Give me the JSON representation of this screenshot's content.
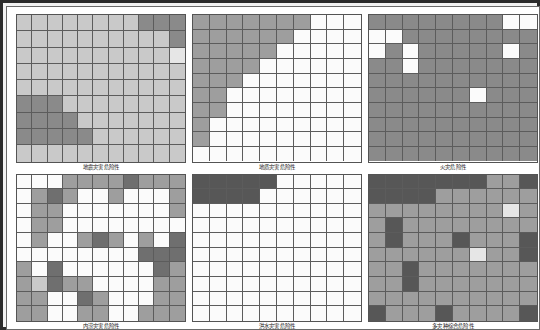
{
  "figure": {
    "title": "",
    "frame_color": "#2b2b2b",
    "background": "#ffffff",
    "grid_line_color": "#5c5c5c",
    "rows": 2,
    "columns": 3
  },
  "legend_palette": {
    "white": "#fbfbfb",
    "very_light": "#e6e6e6",
    "light": "#c9c9c9",
    "medium_light": "#b4b4b4",
    "medium": "#9e9e9e",
    "medium_dark": "#8a8a8a",
    "dark": "#6f6f6f",
    "very_dark": "#575757"
  },
  "chart_data": {
    "type": "heatmap",
    "title": "",
    "subtitle": "",
    "xlabel": "",
    "ylabel": "",
    "grid": true,
    "legend_position": "none",
    "colorscale": "grayscale (light = low hazard, dark = high hazard)",
    "panels": [
      {
        "id": "panel-earthquake-hazard",
        "caption": "地震灾害危险性",
        "cols": 11,
        "rows": 9,
        "values": [
          [
            "#c9c9c9",
            "#c9c9c9",
            "#c9c9c9",
            "#c9c9c9",
            "#c9c9c9",
            "#c9c9c9",
            "#c9c9c9",
            "#c9c9c9",
            "#8a8a8a",
            "#8a8a8a",
            "#8a8a8a"
          ],
          [
            "#c9c9c9",
            "#c9c9c9",
            "#c9c9c9",
            "#c9c9c9",
            "#c9c9c9",
            "#c9c9c9",
            "#c9c9c9",
            "#c9c9c9",
            "#c9c9c9",
            "#c9c9c9",
            "#8a8a8a"
          ],
          [
            "#c9c9c9",
            "#c9c9c9",
            "#c9c9c9",
            "#c9c9c9",
            "#c9c9c9",
            "#c9c9c9",
            "#c9c9c9",
            "#c9c9c9",
            "#c9c9c9",
            "#c9c9c9",
            "#e6e6e6"
          ],
          [
            "#c9c9c9",
            "#c9c9c9",
            "#c9c9c9",
            "#c9c9c9",
            "#c9c9c9",
            "#c9c9c9",
            "#c9c9c9",
            "#c9c9c9",
            "#c9c9c9",
            "#c9c9c9",
            "#c9c9c9"
          ],
          [
            "#c9c9c9",
            "#c9c9c9",
            "#c9c9c9",
            "#c9c9c9",
            "#c9c9c9",
            "#c9c9c9",
            "#c9c9c9",
            "#c9c9c9",
            "#c9c9c9",
            "#c9c9c9",
            "#c9c9c9"
          ],
          [
            "#8a8a8a",
            "#8a8a8a",
            "#8a8a8a",
            "#c9c9c9",
            "#c9c9c9",
            "#c9c9c9",
            "#c9c9c9",
            "#c9c9c9",
            "#c9c9c9",
            "#c9c9c9",
            "#c9c9c9"
          ],
          [
            "#8a8a8a",
            "#8a8a8a",
            "#8a8a8a",
            "#8a8a8a",
            "#c9c9c9",
            "#c9c9c9",
            "#c9c9c9",
            "#c9c9c9",
            "#c9c9c9",
            "#c9c9c9",
            "#c9c9c9"
          ],
          [
            "#8a8a8a",
            "#8a8a8a",
            "#8a8a8a",
            "#8a8a8a",
            "#8a8a8a",
            "#c9c9c9",
            "#c9c9c9",
            "#c9c9c9",
            "#c9c9c9",
            "#c9c9c9",
            "#c9c9c9"
          ],
          [
            "#c9c9c9",
            "#c9c9c9",
            "#c9c9c9",
            "#c9c9c9",
            "#c9c9c9",
            "#c9c9c9",
            "#c9c9c9",
            "#c9c9c9",
            "#c9c9c9",
            "#c9c9c9",
            "#c9c9c9"
          ]
        ]
      },
      {
        "id": "panel-geological-hazard",
        "caption": "地质灾害危险性",
        "cols": 10,
        "rows": 10,
        "values": [
          [
            "#9e9e9e",
            "#9e9e9e",
            "#9e9e9e",
            "#9e9e9e",
            "#9e9e9e",
            "#9e9e9e",
            "#9e9e9e",
            "#fbfbfb",
            "#fbfbfb",
            "#fbfbfb"
          ],
          [
            "#9e9e9e",
            "#9e9e9e",
            "#9e9e9e",
            "#9e9e9e",
            "#9e9e9e",
            "#9e9e9e",
            "#fbfbfb",
            "#fbfbfb",
            "#fbfbfb",
            "#fbfbfb"
          ],
          [
            "#9e9e9e",
            "#9e9e9e",
            "#9e9e9e",
            "#9e9e9e",
            "#9e9e9e",
            "#fbfbfb",
            "#fbfbfb",
            "#fbfbfb",
            "#fbfbfb",
            "#fbfbfb"
          ],
          [
            "#9e9e9e",
            "#9e9e9e",
            "#9e9e9e",
            "#9e9e9e",
            "#fbfbfb",
            "#fbfbfb",
            "#fbfbfb",
            "#fbfbfb",
            "#fbfbfb",
            "#fbfbfb"
          ],
          [
            "#9e9e9e",
            "#9e9e9e",
            "#9e9e9e",
            "#fbfbfb",
            "#fbfbfb",
            "#fbfbfb",
            "#fbfbfb",
            "#fbfbfb",
            "#fbfbfb",
            "#fbfbfb"
          ],
          [
            "#9e9e9e",
            "#9e9e9e",
            "#fbfbfb",
            "#fbfbfb",
            "#fbfbfb",
            "#fbfbfb",
            "#fbfbfb",
            "#fbfbfb",
            "#fbfbfb",
            "#fbfbfb"
          ],
          [
            "#9e9e9e",
            "#9e9e9e",
            "#fbfbfb",
            "#fbfbfb",
            "#fbfbfb",
            "#fbfbfb",
            "#fbfbfb",
            "#fbfbfb",
            "#fbfbfb",
            "#fbfbfb"
          ],
          [
            "#9e9e9e",
            "#fbfbfb",
            "#fbfbfb",
            "#fbfbfb",
            "#fbfbfb",
            "#fbfbfb",
            "#fbfbfb",
            "#fbfbfb",
            "#fbfbfb",
            "#fbfbfb"
          ],
          [
            "#9e9e9e",
            "#fbfbfb",
            "#fbfbfb",
            "#fbfbfb",
            "#fbfbfb",
            "#fbfbfb",
            "#fbfbfb",
            "#fbfbfb",
            "#fbfbfb",
            "#fbfbfb"
          ],
          [
            "#fbfbfb",
            "#fbfbfb",
            "#fbfbfb",
            "#fbfbfb",
            "#fbfbfb",
            "#fbfbfb",
            "#fbfbfb",
            "#fbfbfb",
            "#fbfbfb",
            "#fbfbfb"
          ]
        ]
      },
      {
        "id": "panel-fire-hazard",
        "caption": "火灾危险性",
        "cols": 10,
        "rows": 10,
        "values": [
          [
            "#8a8a8a",
            "#8a8a8a",
            "#8a8a8a",
            "#8a8a8a",
            "#8a8a8a",
            "#8a8a8a",
            "#8a8a8a",
            "#8a8a8a",
            "#fbfbfb",
            "#fbfbfb"
          ],
          [
            "#fbfbfb",
            "#fbfbfb",
            "#8a8a8a",
            "#8a8a8a",
            "#8a8a8a",
            "#8a8a8a",
            "#8a8a8a",
            "#8a8a8a",
            "#8a8a8a",
            "#8a8a8a"
          ],
          [
            "#fbfbfb",
            "#8a8a8a",
            "#fbfbfb",
            "#8a8a8a",
            "#8a8a8a",
            "#8a8a8a",
            "#8a8a8a",
            "#8a8a8a",
            "#fbfbfb",
            "#8a8a8a"
          ],
          [
            "#8a8a8a",
            "#8a8a8a",
            "#fbfbfb",
            "#8a8a8a",
            "#8a8a8a",
            "#8a8a8a",
            "#8a8a8a",
            "#8a8a8a",
            "#8a8a8a",
            "#8a8a8a"
          ],
          [
            "#8a8a8a",
            "#8a8a8a",
            "#8a8a8a",
            "#8a8a8a",
            "#8a8a8a",
            "#8a8a8a",
            "#8a8a8a",
            "#8a8a8a",
            "#8a8a8a",
            "#8a8a8a"
          ],
          [
            "#8a8a8a",
            "#8a8a8a",
            "#8a8a8a",
            "#8a8a8a",
            "#8a8a8a",
            "#8a8a8a",
            "#fbfbfb",
            "#8a8a8a",
            "#8a8a8a",
            "#8a8a8a"
          ],
          [
            "#8a8a8a",
            "#8a8a8a",
            "#8a8a8a",
            "#8a8a8a",
            "#8a8a8a",
            "#8a8a8a",
            "#8a8a8a",
            "#8a8a8a",
            "#8a8a8a",
            "#8a8a8a"
          ],
          [
            "#8a8a8a",
            "#8a8a8a",
            "#8a8a8a",
            "#8a8a8a",
            "#8a8a8a",
            "#8a8a8a",
            "#8a8a8a",
            "#8a8a8a",
            "#8a8a8a",
            "#8a8a8a"
          ],
          [
            "#8a8a8a",
            "#8a8a8a",
            "#8a8a8a",
            "#8a8a8a",
            "#8a8a8a",
            "#8a8a8a",
            "#8a8a8a",
            "#8a8a8a",
            "#8a8a8a",
            "#8a8a8a"
          ],
          [
            "#8a8a8a",
            "#8a8a8a",
            "#8a8a8a",
            "#8a8a8a",
            "#8a8a8a",
            "#8a8a8a",
            "#8a8a8a",
            "#8a8a8a",
            "#8a8a8a",
            "#8a8a8a"
          ]
        ]
      },
      {
        "id": "panel-waterlogging-hazard",
        "caption": "内涝灾害危险性",
        "cols": 11,
        "rows": 10,
        "values": [
          [
            "#fbfbfb",
            "#fbfbfb",
            "#fbfbfb",
            "#9e9e9e",
            "#9e9e9e",
            "#9e9e9e",
            "#9e9e9e",
            "#6f6f6f",
            "#9e9e9e",
            "#9e9e9e",
            "#9e9e9e"
          ],
          [
            "#fbfbfb",
            "#9e9e9e",
            "#6f6f6f",
            "#9e9e9e",
            "#fbfbfb",
            "#fbfbfb",
            "#9e9e9e",
            "#fbfbfb",
            "#fbfbfb",
            "#fbfbfb",
            "#9e9e9e"
          ],
          [
            "#fbfbfb",
            "#9e9e9e",
            "#9e9e9e",
            "#fbfbfb",
            "#fbfbfb",
            "#fbfbfb",
            "#fbfbfb",
            "#fbfbfb",
            "#fbfbfb",
            "#fbfbfb",
            "#9e9e9e"
          ],
          [
            "#fbfbfb",
            "#9e9e9e",
            "#9e9e9e",
            "#fbfbfb",
            "#fbfbfb",
            "#fbfbfb",
            "#fbfbfb",
            "#fbfbfb",
            "#fbfbfb",
            "#fbfbfb",
            "#fbfbfb"
          ],
          [
            "#fbfbfb",
            "#9e9e9e",
            "#fbfbfb",
            "#fbfbfb",
            "#9e9e9e",
            "#6f6f6f",
            "#9e9e9e",
            "#fbfbfb",
            "#9e9e9e",
            "#fbfbfb",
            "#6f6f6f"
          ],
          [
            "#fbfbfb",
            "#fbfbfb",
            "#fbfbfb",
            "#fbfbfb",
            "#fbfbfb",
            "#fbfbfb",
            "#fbfbfb",
            "#fbfbfb",
            "#6f6f6f",
            "#6f6f6f",
            "#6f6f6f"
          ],
          [
            "#9e9e9e",
            "#fbfbfb",
            "#6f6f6f",
            "#fbfbfb",
            "#fbfbfb",
            "#fbfbfb",
            "#fbfbfb",
            "#fbfbfb",
            "#fbfbfb",
            "#6f6f6f",
            "#9e9e9e"
          ],
          [
            "#9e9e9e",
            "#c9c9c9",
            "#6f6f6f",
            "#9e9e9e",
            "#9e9e9e",
            "#fbfbfb",
            "#fbfbfb",
            "#fbfbfb",
            "#fbfbfb",
            "#9e9e9e",
            "#9e9e9e"
          ],
          [
            "#9e9e9e",
            "#9e9e9e",
            "#fbfbfb",
            "#fbfbfb",
            "#6f6f6f",
            "#9e9e9e",
            "#fbfbfb",
            "#fbfbfb",
            "#fbfbfb",
            "#9e9e9e",
            "#9e9e9e"
          ],
          [
            "#9e9e9e",
            "#9e9e9e",
            "#fbfbfb",
            "#fbfbfb",
            "#9e9e9e",
            "#9e9e9e",
            "#fbfbfb",
            "#fbfbfb",
            "#9e9e9e",
            "#9e9e9e",
            "#9e9e9e"
          ]
        ]
      },
      {
        "id": "panel-flood-hazard",
        "caption": "洪水灾害危险性",
        "cols": 10,
        "rows": 10,
        "values": [
          [
            "#575757",
            "#575757",
            "#575757",
            "#575757",
            "#575757",
            "#fbfbfb",
            "#fbfbfb",
            "#fbfbfb",
            "#fbfbfb",
            "#fbfbfb"
          ],
          [
            "#575757",
            "#575757",
            "#575757",
            "#575757",
            "#fbfbfb",
            "#fbfbfb",
            "#fbfbfb",
            "#fbfbfb",
            "#fbfbfb",
            "#fbfbfb"
          ],
          [
            "#fbfbfb",
            "#fbfbfb",
            "#fbfbfb",
            "#fbfbfb",
            "#fbfbfb",
            "#fbfbfb",
            "#fbfbfb",
            "#fbfbfb",
            "#fbfbfb",
            "#fbfbfb"
          ],
          [
            "#fbfbfb",
            "#fbfbfb",
            "#fbfbfb",
            "#fbfbfb",
            "#fbfbfb",
            "#fbfbfb",
            "#fbfbfb",
            "#fbfbfb",
            "#fbfbfb",
            "#fbfbfb"
          ],
          [
            "#fbfbfb",
            "#fbfbfb",
            "#fbfbfb",
            "#fbfbfb",
            "#fbfbfb",
            "#fbfbfb",
            "#fbfbfb",
            "#fbfbfb",
            "#fbfbfb",
            "#fbfbfb"
          ],
          [
            "#fbfbfb",
            "#fbfbfb",
            "#fbfbfb",
            "#fbfbfb",
            "#fbfbfb",
            "#fbfbfb",
            "#fbfbfb",
            "#fbfbfb",
            "#fbfbfb",
            "#fbfbfb"
          ],
          [
            "#fbfbfb",
            "#fbfbfb",
            "#fbfbfb",
            "#fbfbfb",
            "#fbfbfb",
            "#fbfbfb",
            "#fbfbfb",
            "#fbfbfb",
            "#fbfbfb",
            "#fbfbfb"
          ],
          [
            "#fbfbfb",
            "#fbfbfb",
            "#fbfbfb",
            "#fbfbfb",
            "#fbfbfb",
            "#fbfbfb",
            "#fbfbfb",
            "#fbfbfb",
            "#fbfbfb",
            "#fbfbfb"
          ],
          [
            "#fbfbfb",
            "#fbfbfb",
            "#fbfbfb",
            "#fbfbfb",
            "#fbfbfb",
            "#fbfbfb",
            "#fbfbfb",
            "#fbfbfb",
            "#fbfbfb",
            "#fbfbfb"
          ],
          [
            "#fbfbfb",
            "#fbfbfb",
            "#fbfbfb",
            "#fbfbfb",
            "#fbfbfb",
            "#fbfbfb",
            "#fbfbfb",
            "#fbfbfb",
            "#fbfbfb",
            "#fbfbfb"
          ]
        ]
      },
      {
        "id": "panel-multihazard-composite",
        "caption": "多灾种综合危险性",
        "cols": 10,
        "rows": 10,
        "values": [
          [
            "#575757",
            "#575757",
            "#575757",
            "#575757",
            "#575757",
            "#575757",
            "#575757",
            "#9e9e9e",
            "#9e9e9e",
            "#575757"
          ],
          [
            "#575757",
            "#575757",
            "#575757",
            "#575757",
            "#9e9e9e",
            "#9e9e9e",
            "#9e9e9e",
            "#9e9e9e",
            "#9e9e9e",
            "#9e9e9e"
          ],
          [
            "#9e9e9e",
            "#9e9e9e",
            "#9e9e9e",
            "#9e9e9e",
            "#9e9e9e",
            "#9e9e9e",
            "#9e9e9e",
            "#9e9e9e",
            "#e6e6e6",
            "#9e9e9e"
          ],
          [
            "#9e9e9e",
            "#575757",
            "#9e9e9e",
            "#9e9e9e",
            "#9e9e9e",
            "#9e9e9e",
            "#9e9e9e",
            "#9e9e9e",
            "#9e9e9e",
            "#9e9e9e"
          ],
          [
            "#9e9e9e",
            "#575757",
            "#9e9e9e",
            "#9e9e9e",
            "#9e9e9e",
            "#575757",
            "#9e9e9e",
            "#9e9e9e",
            "#9e9e9e",
            "#575757"
          ],
          [
            "#9e9e9e",
            "#9e9e9e",
            "#9e9e9e",
            "#9e9e9e",
            "#9e9e9e",
            "#9e9e9e",
            "#e6e6e6",
            "#9e9e9e",
            "#9e9e9e",
            "#575757"
          ],
          [
            "#9e9e9e",
            "#9e9e9e",
            "#575757",
            "#9e9e9e",
            "#9e9e9e",
            "#9e9e9e",
            "#9e9e9e",
            "#9e9e9e",
            "#9e9e9e",
            "#9e9e9e"
          ],
          [
            "#9e9e9e",
            "#9e9e9e",
            "#575757",
            "#9e9e9e",
            "#9e9e9e",
            "#9e9e9e",
            "#9e9e9e",
            "#9e9e9e",
            "#9e9e9e",
            "#9e9e9e"
          ],
          [
            "#9e9e9e",
            "#9e9e9e",
            "#9e9e9e",
            "#9e9e9e",
            "#9e9e9e",
            "#9e9e9e",
            "#9e9e9e",
            "#9e9e9e",
            "#9e9e9e",
            "#9e9e9e"
          ],
          [
            "#575757",
            "#9e9e9e",
            "#9e9e9e",
            "#9e9e9e",
            "#575757",
            "#9e9e9e",
            "#9e9e9e",
            "#9e9e9e",
            "#9e9e9e",
            "#575757"
          ]
        ]
      }
    ]
  }
}
